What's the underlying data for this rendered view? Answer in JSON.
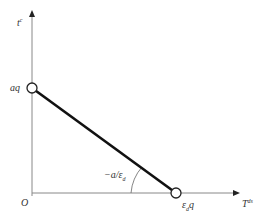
{
  "diagram": {
    "y_axis_label": "t",
    "y_axis_label_sup": "c",
    "x_axis_label": "T",
    "x_axis_label_sup": "ds",
    "origin_label": "O",
    "y_intercept_label": "aq",
    "x_intercept_label_main": "ε",
    "x_intercept_label_sub": "d",
    "x_intercept_label_tail": "q",
    "slope_label_prefix": "−a/ε",
    "slope_label_sub": "d",
    "colors": {
      "axis": "#888888",
      "line": "#111111",
      "text": "#333333"
    }
  }
}
